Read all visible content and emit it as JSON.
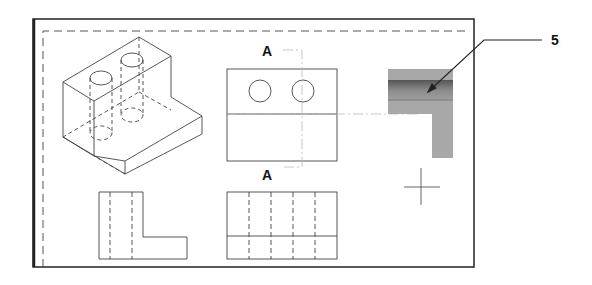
{
  "drawing": {
    "section_label_top": "A",
    "section_label_bottom": "A",
    "callout_number": "5"
  },
  "views": [
    {
      "name": "isometric-view",
      "description": "Isometric view of L-shaped block with two vertical holes"
    },
    {
      "name": "top-view",
      "description": "Top view with two circular holes"
    },
    {
      "name": "front-view",
      "description": "Front view with hidden hole lines"
    },
    {
      "name": "side-view",
      "description": "Side view L-profile with hidden lines"
    },
    {
      "name": "section-view",
      "description": "Shaded section A-A view"
    }
  ],
  "colors": {
    "line": "#444444",
    "frame": "#222222",
    "section_fill": "#a8a8a8",
    "section_dark": "#6a6a6a"
  }
}
